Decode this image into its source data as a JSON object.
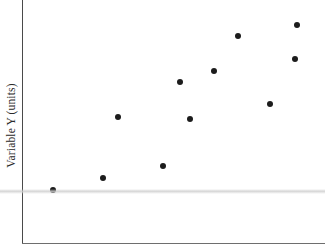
{
  "chart_data": {
    "type": "scatter",
    "title": "",
    "xlabel": "",
    "ylabel": "Variable Y (units)",
    "grid": false,
    "legend": null,
    "marker_color": "#1c1c1c",
    "marker_size_px": 6,
    "axis_color": "#4a4a4a",
    "background": "#ffffff",
    "xlim": [
      0,
      10
    ],
    "ylim": [
      0,
      10
    ],
    "x": [
      1.0,
      2.7,
      3.2,
      4.7,
      5.2,
      5.6,
      6.4,
      7.2,
      8.2,
      9.0,
      9.1
    ],
    "y": [
      2.2,
      2.7,
      5.2,
      3.2,
      6.7,
      5.1,
      7.1,
      8.5,
      5.8,
      7.6,
      9.0
    ],
    "points": [
      {
        "x": 1.0,
        "y": 2.2,
        "px": 53,
        "py": 190
      },
      {
        "x": 2.7,
        "y": 2.7,
        "px": 103,
        "py": 178
      },
      {
        "x": 3.2,
        "y": 5.2,
        "px": 118,
        "py": 117
      },
      {
        "x": 4.7,
        "y": 3.2,
        "px": 163,
        "py": 166
      },
      {
        "x": 5.2,
        "y": 6.7,
        "px": 180,
        "py": 82
      },
      {
        "x": 5.6,
        "y": 5.1,
        "px": 190,
        "py": 119
      },
      {
        "x": 6.4,
        "y": 7.1,
        "px": 214,
        "py": 71
      },
      {
        "x": 7.2,
        "y": 8.5,
        "px": 238,
        "py": 36
      },
      {
        "x": 8.2,
        "y": 5.8,
        "px": 270,
        "py": 104
      },
      {
        "x": 9.0,
        "y": 7.6,
        "px": 295,
        "py": 59
      },
      {
        "x": 9.1,
        "y": 9.0,
        "px": 297,
        "py": 25
      }
    ],
    "xtick_labels": [],
    "ytick_labels": [],
    "n_points": 11,
    "trend": "positive"
  },
  "axes": {
    "y_label": "Variable Y (units)",
    "x_label": ""
  }
}
